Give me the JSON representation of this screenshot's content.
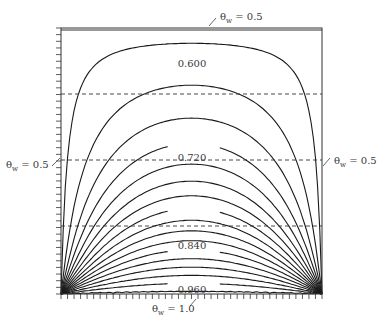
{
  "diagram": {
    "type": "isotherm contour plot",
    "frame": {
      "left": 61,
      "top": 28,
      "right": 322,
      "bottom": 294
    },
    "colors": {
      "curve": "#1a1a1a",
      "frame": "#333333",
      "dashed": "#333333",
      "text": "#3a3a3a"
    },
    "boundary_labels": {
      "top": {
        "symbol": "θ",
        "sub": "w",
        "text": " = 0.5"
      },
      "left": {
        "symbol": "θ",
        "sub": "w",
        "text": " = 0.5"
      },
      "right": {
        "symbol": "θ",
        "sub": "w",
        "text": " = 0.5"
      },
      "bottom": {
        "symbol": "θ",
        "sub": "w",
        "text": " = 1.0"
      }
    },
    "contour_labels": [
      {
        "text": "0.600",
        "x": 192,
        "y": 64
      },
      {
        "text": "0.720",
        "x": 192,
        "y": 158
      },
      {
        "text": "0.840",
        "x": 192,
        "y": 246
      },
      {
        "text": "0.960",
        "x": 192,
        "y": 290
      }
    ],
    "contour_values": [
      0.51,
      0.54,
      0.57,
      0.6,
      0.63,
      0.66,
      0.69,
      0.72,
      0.75,
      0.78,
      0.81,
      0.84,
      0.87,
      0.9,
      0.93,
      0.96,
      0.99
    ],
    "dashed_lines_y": [
      94,
      160,
      226
    ],
    "tick_count_left": 40,
    "tick_count_bottom": 40
  }
}
